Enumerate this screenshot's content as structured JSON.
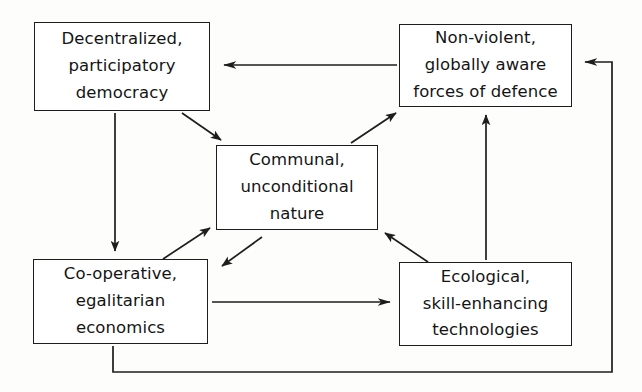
{
  "diagram": {
    "type": "cycle-flow-diagram",
    "stroke_color": "#1d1d1d",
    "background_color": "#fdfdfc",
    "nodes": [
      {
        "id": "decentralized",
        "lines": [
          "Decentralized,",
          "participatory",
          "democracy"
        ]
      },
      {
        "id": "nonviolent",
        "lines": [
          "Non-violent,",
          "globally aware",
          "forces of defence"
        ]
      },
      {
        "id": "communal",
        "lines": [
          "Communal,",
          "unconditional",
          "nature"
        ]
      },
      {
        "id": "cooperative",
        "lines": [
          "Co-operative,",
          "egalitarian",
          "economics"
        ]
      },
      {
        "id": "ecological",
        "lines": [
          "Ecological,",
          "skill-enhancing",
          "technologies"
        ]
      }
    ],
    "connectors": [
      {
        "id": "nonviolent-to-decentralized",
        "from": "nonviolent",
        "to": "decentralized",
        "style": "straight-horizontal"
      },
      {
        "id": "decentralized-to-cooperative",
        "from": "decentralized",
        "to": "cooperative",
        "style": "straight-vertical"
      },
      {
        "id": "decentralized-to-communal",
        "from": "decentralized",
        "to": "communal",
        "style": "diagonal"
      },
      {
        "id": "communal-to-nonviolent",
        "from": "communal",
        "to": "nonviolent",
        "style": "diagonal"
      },
      {
        "id": "cooperative-to-communal",
        "from": "cooperative",
        "to": "communal",
        "style": "diagonal"
      },
      {
        "id": "communal-to-cooperative",
        "from": "communal",
        "to": "cooperative",
        "style": "diagonal"
      },
      {
        "id": "ecological-to-communal",
        "from": "ecological",
        "to": "communal",
        "style": "diagonal"
      },
      {
        "id": "ecological-to-nonviolent",
        "from": "ecological",
        "to": "nonviolent",
        "style": "straight-vertical"
      },
      {
        "id": "cooperative-to-ecological",
        "from": "cooperative",
        "to": "ecological",
        "style": "straight-horizontal"
      },
      {
        "id": "cooperative-to-nonviolent-loop",
        "from": "cooperative",
        "to": "nonviolent",
        "style": "elbow-loop"
      }
    ]
  }
}
